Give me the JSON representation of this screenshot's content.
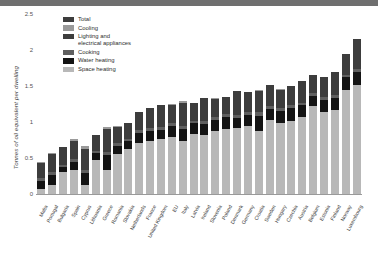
{
  "chart_data": {
    "type": "bar",
    "subtype": "stacked-bar",
    "title": "",
    "xlabel": "",
    "ylabel": "Tonnes of oil equivalent per dwelling",
    "ylim": [
      0,
      2.5
    ],
    "yticks": [
      0,
      0.5,
      1,
      1.5,
      2,
      2.5
    ],
    "ytick_labels": [
      "0",
      "0.5",
      "1",
      "1.5",
      "2",
      "2.5"
    ],
    "grid": false,
    "legend_position": "top-left",
    "legend": [
      {
        "label": "Total",
        "color": "#3d3d3d"
      },
      {
        "label": "Cooling",
        "color": "#9a9a9a"
      },
      {
        "label": "Lighting and electrical appliances",
        "color": "#3d3d3d"
      },
      {
        "label": "Cooking",
        "color": "#5f5f5f"
      },
      {
        "label": "Water heating",
        "color": "#141414"
      },
      {
        "label": "Space heating",
        "color": "#b8b8b8"
      }
    ],
    "categories": [
      "Malta",
      "Portugal",
      "Bulgaria",
      "Spain",
      "Cyprus",
      "Lithuania",
      "Greece",
      "Romania",
      "Slovakia",
      "Netherlands",
      "France",
      "United Kingdom",
      "EU",
      "Italy",
      "Latvia",
      "Ireland",
      "Slovenia",
      "Poland",
      "Denmark",
      "Germany",
      "Croatia",
      "Sweden",
      "Hungary",
      "Czechia",
      "Austria",
      "Belgium",
      "Estonia",
      "Finland",
      "Norway",
      "Luxembourg"
    ],
    "series": [
      {
        "name": "Space heating",
        "color": "#b8b8b8",
        "values": [
          0.07,
          0.12,
          0.31,
          0.33,
          0.12,
          0.47,
          0.34,
          0.55,
          0.62,
          0.71,
          0.73,
          0.76,
          0.79,
          0.74,
          0.84,
          0.82,
          0.88,
          0.9,
          0.92,
          0.95,
          0.88,
          1.03,
          0.99,
          1.02,
          1.07,
          1.22,
          1.14,
          1.17,
          1.45,
          1.52
        ]
      },
      {
        "name": "Water heating",
        "color": "#141414",
        "values": [
          0.11,
          0.15,
          0.07,
          0.11,
          0.17,
          0.1,
          0.2,
          0.12,
          0.11,
          0.14,
          0.14,
          0.13,
          0.15,
          0.16,
          0.14,
          0.15,
          0.15,
          0.17,
          0.14,
          0.15,
          0.21,
          0.15,
          0.16,
          0.17,
          0.16,
          0.14,
          0.17,
          0.16,
          0.17,
          0.17
        ]
      },
      {
        "name": "Cooking",
        "color": "#5f5f5f",
        "values": [
          0.04,
          0.04,
          0.03,
          0.04,
          0.04,
          0.03,
          0.04,
          0.04,
          0.03,
          0.04,
          0.05,
          0.04,
          0.04,
          0.05,
          0.04,
          0.04,
          0.04,
          0.04,
          0.04,
          0.04,
          0.05,
          0.04,
          0.04,
          0.04,
          0.04,
          0.04,
          0.04,
          0.04,
          0.04,
          0.05
        ]
      },
      {
        "name": "Lighting and electrical appliances",
        "color": "#3d3d3d",
        "values": [
          0.21,
          0.25,
          0.24,
          0.26,
          0.3,
          0.22,
          0.32,
          0.22,
          0.22,
          0.25,
          0.27,
          0.3,
          0.26,
          0.32,
          0.25,
          0.33,
          0.25,
          0.24,
          0.33,
          0.28,
          0.29,
          0.3,
          0.26,
          0.27,
          0.3,
          0.25,
          0.27,
          0.32,
          0.28,
          0.41
        ]
      },
      {
        "name": "Cooling",
        "color": "#9a9a9a",
        "values": [
          0.02,
          0.01,
          0.01,
          0.02,
          0.04,
          0.0,
          0.03,
          0.01,
          0.0,
          0.0,
          0.01,
          0.0,
          0.01,
          0.02,
          0.0,
          0.0,
          0.01,
          0.0,
          0.0,
          0.0,
          0.01,
          0.0,
          0.01,
          0.0,
          0.0,
          0.0,
          0.0,
          0.0,
          0.0,
          0.01
        ]
      }
    ],
    "totals": [
      0.45,
      0.57,
      0.66,
      0.76,
      0.67,
      0.82,
      0.93,
      0.94,
      0.98,
      1.14,
      1.2,
      1.23,
      1.25,
      1.29,
      1.27,
      1.34,
      1.33,
      1.35,
      1.43,
      1.42,
      1.44,
      1.52,
      1.46,
      1.5,
      1.57,
      1.65,
      1.62,
      1.69,
      1.94,
      2.16
    ]
  }
}
